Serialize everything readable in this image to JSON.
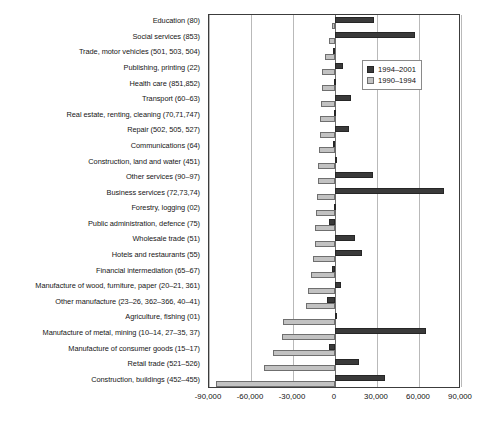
{
  "chart_data": {
    "type": "bar",
    "orientation": "horizontal",
    "title": "",
    "xlabel": "",
    "ylabel": "",
    "xlim": [
      -90000,
      90000
    ],
    "xticks": [
      -90000,
      -60000,
      -30000,
      0,
      30000,
      60000,
      90000
    ],
    "xtick_labels": [
      "-90,000",
      "-60,000",
      "-30,000",
      "0",
      "30,000",
      "60,000",
      "90,000"
    ],
    "grid": true,
    "legend_position": "upper-right-inside",
    "categories": [
      "Education (80)",
      "Social services (853)",
      "Trade, motor vehicles (501, 503, 504)",
      "Publishing, printing (22)",
      "Health care (851,852)",
      "Transport (60–63)",
      "Real estate, renting, cleaning (70,71,747)",
      "Repair (502, 505, 527)",
      "Communications (64)",
      "Construction, land and water (451)",
      "Other services (90–97)",
      "Business services (72,73,74)",
      "Forestry, logging (02)",
      "Public administration, defence (75)",
      "Wholesale trade (51)",
      "Hotels and restaurants (55)",
      "Financial intermediation (65–67)",
      "Manufacture of wood, furniture, paper (20–21, 361)",
      "Other manufacture (23–26, 362–366, 40–41)",
      "Agriculture, fishing (01)",
      "Manufacture of metal, mining (10–14, 27–35, 37)",
      "Manufacture of consumer goods (15–17)",
      "Retail trade (521–526)",
      "Construction, buildings (452–455)"
    ],
    "series": [
      {
        "name": "1994–2001",
        "color": "#3a3a3a",
        "values": [
          28000,
          57000,
          -1500,
          6000,
          -1000,
          11500,
          -1000,
          10000,
          -1500,
          1000,
          27000,
          78000,
          -1000,
          -4000,
          14500,
          19000,
          -2000,
          4000,
          -6000,
          1500,
          65000,
          -4500,
          17000,
          36000
        ]
      },
      {
        "name": "1990–1994",
        "color": "#c2c2c2",
        "values": [
          -2000,
          -4000,
          -7000,
          -9000,
          -9500,
          -10000,
          -10500,
          -11000,
          -11500,
          -12000,
          -12500,
          -13000,
          -13500,
          -14000,
          -14500,
          -16000,
          -17000,
          -19000,
          -21000,
          -37000,
          -38000,
          -44000,
          -51000,
          -85000
        ]
      }
    ]
  },
  "legend": {
    "items": [
      {
        "label": "1994–2001",
        "swatch": "dark"
      },
      {
        "label": "1990–1994",
        "swatch": "light"
      }
    ]
  }
}
